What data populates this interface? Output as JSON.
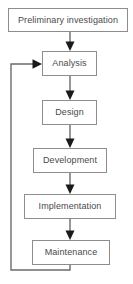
{
  "diagram": {
    "type": "flowchart",
    "orientation": "vertical-top-to-bottom",
    "colors": {
      "background": "#ffffff",
      "box_fill": "#ffffff",
      "box_border": "#8d8d8d",
      "text": "#4a4a4a",
      "connector": "#6b6b6b",
      "arrowhead": "#1a1a1a"
    },
    "nodes": [
      {
        "id": "preliminary-investigation",
        "label": "Preliminary investigation"
      },
      {
        "id": "analysis",
        "label": "Analysis"
      },
      {
        "id": "design",
        "label": "Design"
      },
      {
        "id": "development",
        "label": "Development"
      },
      {
        "id": "implementation",
        "label": "Implementation"
      },
      {
        "id": "maintenance",
        "label": "Maintenance"
      }
    ],
    "edges": [
      {
        "from": "preliminary-investigation",
        "to": "analysis",
        "style": "arrow-down"
      },
      {
        "from": "analysis",
        "to": "design",
        "style": "arrow-down"
      },
      {
        "from": "design",
        "to": "development",
        "style": "arrow-down"
      },
      {
        "from": "development",
        "to": "implementation",
        "style": "arrow-down"
      },
      {
        "from": "implementation",
        "to": "maintenance",
        "style": "arrow-down"
      },
      {
        "from": "maintenance",
        "to": "analysis",
        "style": "feedback-loop-left"
      }
    ]
  }
}
